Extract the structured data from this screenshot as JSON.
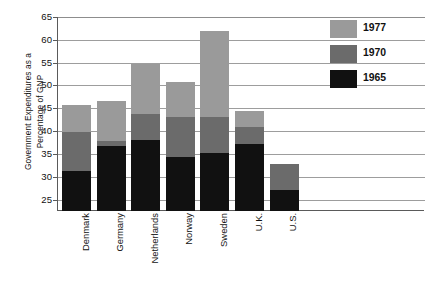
{
  "chart_data": {
    "type": "bar",
    "subtype": "stacked-vertical",
    "title": "",
    "xlabel": "",
    "ylabel": "Government Expenditures as a Percentage of GNP",
    "ylabel_lines": [
      "Government Expenditures as a",
      "Percentage of GNP"
    ],
    "categories": [
      "Denmark",
      "Germany",
      "Netherlands",
      "Norway",
      "Sweden",
      "U.K.",
      "U.S."
    ],
    "series": [
      {
        "name": "1965",
        "color": "#111111",
        "values": [
          31.3,
          36.8,
          38.0,
          34.3,
          35.1,
          37.2,
          27.2
        ]
      },
      {
        "name": "1970",
        "color": "#6b6b6b",
        "values": [
          39.8,
          37.8,
          43.8,
          43.0,
          43.0,
          41.0,
          32.8
        ]
      },
      {
        "name": "1977",
        "color": "#9a9a9a",
        "values": [
          45.8,
          46.6,
          54.8,
          50.8,
          62.0,
          44.3,
          32.8
        ]
      }
    ],
    "stacking_note": "Series values are cumulative tops of each stacked segment, read off the y-axis.",
    "ylim": [
      22.5,
      65
    ],
    "yticks": [
      25,
      30,
      35,
      40,
      45,
      50,
      55,
      60,
      65
    ],
    "ytick_labels": [
      "25",
      "30",
      "35",
      "40",
      "45",
      "50",
      "55",
      "60",
      "65"
    ],
    "grid": true,
    "grid_axis": "y",
    "legend": {
      "position": "top-right",
      "entries": [
        {
          "label": "1977",
          "color": "#9a9a9a"
        },
        {
          "label": "1970",
          "color": "#6b6b6b"
        },
        {
          "label": "1965",
          "color": "#111111"
        }
      ]
    }
  },
  "colors": {
    "background": "#ffffff",
    "axis": "#5a5a5a",
    "grid": "#9d9d9d",
    "text": "#111111",
    "series_1977": "#9a9a9a",
    "series_1970": "#6b6b6b",
    "series_1965": "#111111"
  }
}
